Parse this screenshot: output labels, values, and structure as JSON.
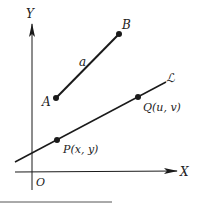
{
  "diagram": {
    "axes": {
      "x_label": "X",
      "y_label": "Y",
      "origin_label": "O"
    },
    "segment": {
      "label": "a",
      "start_label": "A",
      "end_label": "B"
    },
    "line": {
      "label": "ℒ",
      "points": [
        {
          "label": "P(x, y)"
        },
        {
          "label": "Q(u, v)"
        }
      ]
    },
    "colors": {
      "stroke": "#1a1a1a",
      "text": "#222222",
      "rule": "#555555"
    }
  }
}
